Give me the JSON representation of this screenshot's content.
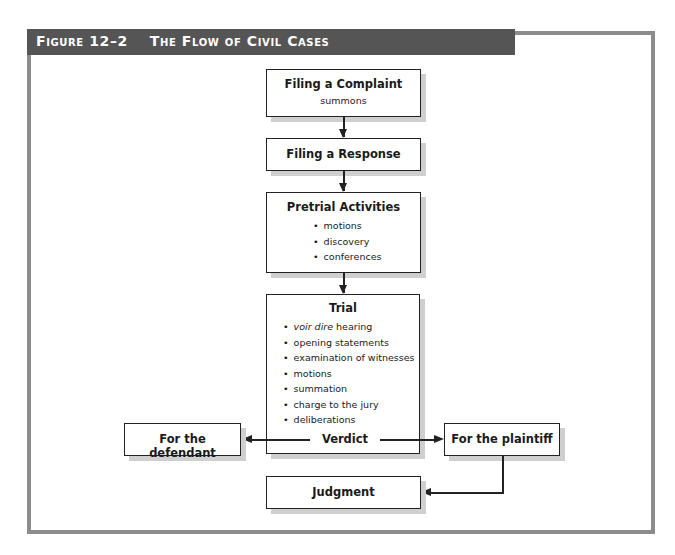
{
  "figure": {
    "number": "Figure 12–2",
    "title": "The Flow of Civil Cases"
  },
  "colors": {
    "header_bg": "#555555",
    "frame": "#8c8c8c",
    "box_border": "#222222",
    "box_shadow": "#cfcfcf"
  },
  "nodes": {
    "complaint": {
      "title": "Filing a Complaint",
      "sub": "summons"
    },
    "response": {
      "title": "Filing a Response"
    },
    "pretrial": {
      "title": "Pretrial Activities",
      "items": [
        "motions",
        "discovery",
        "conferences"
      ]
    },
    "trial": {
      "title": "Trial",
      "items_first_italic": "voir dire",
      "items_first_rest": " hearing",
      "items": [
        "opening statements",
        "examination of witnesses",
        "motions",
        "summation",
        "charge to the jury",
        "deliberations"
      ],
      "verdict": "Verdict"
    },
    "defendant": {
      "title": "For the defendant"
    },
    "plaintiff": {
      "title": "For the plaintiff"
    },
    "judgment": {
      "title": "Judgment"
    }
  },
  "edges": [
    [
      "Filing a Complaint",
      "Filing a Response"
    ],
    [
      "Filing a Response",
      "Pretrial Activities"
    ],
    [
      "Pretrial Activities",
      "Trial"
    ],
    [
      "Verdict",
      "For the defendant"
    ],
    [
      "Verdict",
      "For the plaintiff"
    ],
    [
      "For the plaintiff",
      "Judgment"
    ]
  ]
}
